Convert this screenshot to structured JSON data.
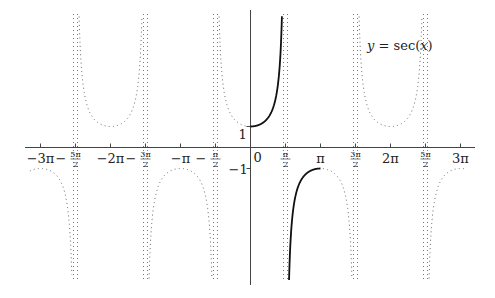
{
  "chart_data": {
    "type": "line",
    "title": "",
    "function_label": "y = sec(x)",
    "xlabel": "",
    "ylabel": "",
    "xlim": [
      -9.9,
      9.6
    ],
    "ylim": [
      -6.3,
      6.3
    ],
    "grid": false,
    "x_ticks": [
      {
        "value": -9.42478,
        "label": "−3π"
      },
      {
        "value": -7.85398,
        "label": "−5π/2",
        "num": "5π",
        "den": "2",
        "neg": true
      },
      {
        "value": -6.28319,
        "label": "−2π"
      },
      {
        "value": -4.71239,
        "label": "−3π/2",
        "num": "3π",
        "den": "2",
        "neg": true
      },
      {
        "value": -3.14159,
        "label": "−π"
      },
      {
        "value": -1.5708,
        "label": "−π/2",
        "num": "π",
        "den": "2",
        "neg": true
      },
      {
        "value": 0,
        "label": "0"
      },
      {
        "value": 1.5708,
        "label": "π/2",
        "num": "π",
        "den": "2",
        "neg": false
      },
      {
        "value": 3.14159,
        "label": "π"
      },
      {
        "value": 4.71239,
        "label": "3π/2",
        "num": "3π",
        "den": "2",
        "neg": false
      },
      {
        "value": 6.28319,
        "label": "2π"
      },
      {
        "value": 7.85398,
        "label": "5π/2",
        "num": "5π",
        "den": "2",
        "neg": false
      },
      {
        "value": 9.42478,
        "label": "3π"
      }
    ],
    "y_ticks": [
      {
        "value": 1,
        "label": "1"
      },
      {
        "value": -1,
        "label": "−1"
      }
    ],
    "asymptotes": [
      -7.85398,
      -4.71239,
      -1.5708,
      1.5708,
      4.71239,
      7.85398
    ],
    "series": [
      {
        "name": "sec(x) full",
        "style": "dotted",
        "color": "#555555",
        "x_range": [
          -9.9,
          9.6
        ]
      },
      {
        "name": "sec(x) principal branch",
        "style": "solid",
        "color": "#111111",
        "x_range": [
          0,
          3.14159
        ],
        "excluding": [
          1.5708
        ]
      }
    ],
    "key_points": [
      {
        "x": 0,
        "y": 1
      },
      {
        "x": 3.14159,
        "y": -1
      }
    ]
  },
  "labels": {
    "function": "y = sec(x)",
    "y_one": "1",
    "y_minus_one": "−1",
    "origin": "0"
  }
}
